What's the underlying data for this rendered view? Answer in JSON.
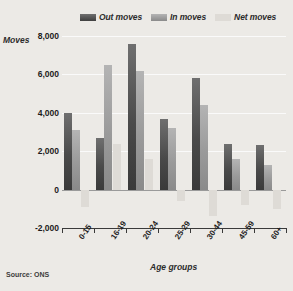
{
  "chart_data": {
    "type": "bar",
    "title": "",
    "subtitle": "",
    "xlabel": "Age groups",
    "ylabel": "Moves",
    "categories": [
      "0-15",
      "16-19",
      "20-24",
      "25-29",
      "30-44",
      "45-59",
      "60+"
    ],
    "series": [
      {
        "name": "Out moves",
        "values": [
          4000,
          2700,
          7600,
          3700,
          5800,
          2400,
          2300
        ],
        "color": "#4a4a4a"
      },
      {
        "name": "In moves",
        "values": [
          3100,
          6500,
          6200,
          3200,
          4400,
          1600,
          1300
        ],
        "color": "#9a9a9a"
      },
      {
        "name": "Net moves",
        "values": [
          -900,
          2400,
          1600,
          -600,
          -1400,
          -800,
          -1000
        ],
        "color": "#dedbd6"
      }
    ],
    "ylim": [
      -2000,
      8000
    ],
    "yticks": [
      8000,
      6000,
      4000,
      2000,
      0,
      -2000
    ],
    "ytick_labels": [
      "8,000",
      "6,000",
      "4,000",
      "2,000",
      "0",
      "-2,000"
    ],
    "grid": true,
    "legend_position": "top-right",
    "source": "Source: ONS"
  },
  "legend": {
    "items": [
      {
        "label": "Out moves"
      },
      {
        "label": "In moves"
      },
      {
        "label": "Net moves"
      }
    ]
  },
  "axes": {
    "y_title": "Moves",
    "x_title": "Age groups"
  },
  "footer": {
    "source": "Source: ONS"
  },
  "colors": {
    "background": "#eceae6",
    "out_moves": "#4a4a4a",
    "in_moves": "#9a9a9a",
    "net_moves": "#dedbd6",
    "gridline": "#fafafa",
    "axis": "#3a3a3a"
  }
}
